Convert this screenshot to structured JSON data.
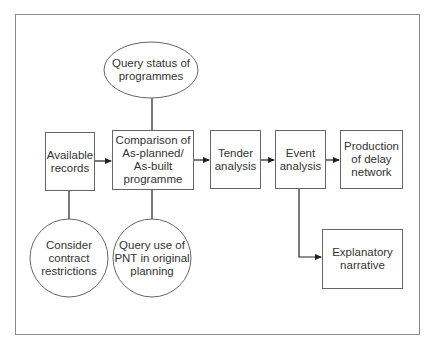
{
  "diagram": {
    "type": "flowchart",
    "nodes": [
      {
        "id": "available-records",
        "shape": "rectangle",
        "lines": [
          "Available",
          "records"
        ]
      },
      {
        "id": "comparison",
        "shape": "rectangle",
        "lines": [
          "Comparison of",
          "As-planned/",
          "As-built",
          "programme"
        ]
      },
      {
        "id": "tender-analysis",
        "shape": "rectangle",
        "lines": [
          "Tender",
          "analysis"
        ]
      },
      {
        "id": "event-analysis",
        "shape": "rectangle",
        "lines": [
          "Event",
          "analysis"
        ]
      },
      {
        "id": "production-delay-network",
        "shape": "rectangle",
        "lines": [
          "Production",
          "of delay",
          "network"
        ]
      },
      {
        "id": "query-status",
        "shape": "ellipse",
        "lines": [
          "Query status of",
          "programmes"
        ]
      },
      {
        "id": "consider-contract",
        "shape": "circle",
        "lines": [
          "Consider",
          "contract",
          "restrictions"
        ]
      },
      {
        "id": "query-pnt",
        "shape": "circle",
        "lines": [
          "Query use of",
          "PNT in original",
          "planning"
        ]
      },
      {
        "id": "explanatory-narrative",
        "shape": "rectangle",
        "lines": [
          "Explanatory",
          "narrative"
        ]
      }
    ],
    "edges": [
      {
        "from": "available-records",
        "to": "comparison",
        "arrow": true
      },
      {
        "from": "comparison",
        "to": "tender-analysis",
        "arrow": true
      },
      {
        "from": "tender-analysis",
        "to": "event-analysis",
        "arrow": true
      },
      {
        "from": "event-analysis",
        "to": "production-delay-network",
        "arrow": true
      },
      {
        "from": "event-analysis",
        "to": "explanatory-narrative",
        "arrow": true,
        "route": "elbow"
      },
      {
        "from": "query-status",
        "to": "comparison",
        "arrow": false
      },
      {
        "from": "available-records",
        "to": "consider-contract",
        "arrow": false
      },
      {
        "from": "comparison",
        "to": "query-pnt",
        "arrow": false
      }
    ]
  },
  "colors": {
    "stroke": "#555555",
    "frame": "#8a8a8a",
    "text": "#333333",
    "background": "#ffffff"
  }
}
